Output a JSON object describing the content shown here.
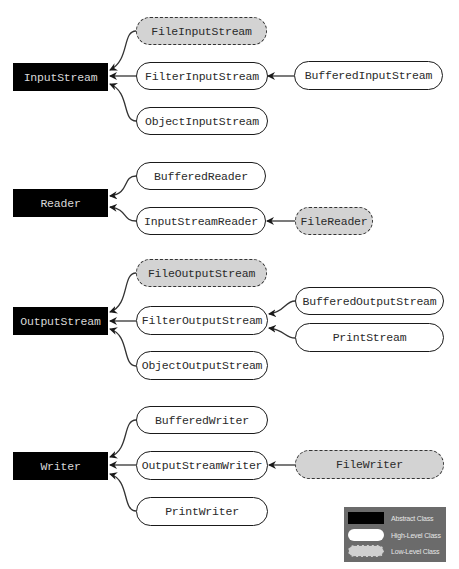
{
  "diagram": {
    "groups": [
      {
        "root": "InputStream",
        "children": [
          "FileInputStream",
          "FilterInputStream",
          "ObjectInputStream"
        ],
        "subchildren": [
          {
            "parent": "FilterInputStream",
            "children": [
              "BufferedInputStream"
            ]
          }
        ]
      },
      {
        "root": "Reader",
        "children": [
          "BufferedReader",
          "InputStreamReader"
        ],
        "subchildren": [
          {
            "parent": "InputStreamReader",
            "children": [
              "FileReader"
            ]
          }
        ]
      },
      {
        "root": "OutputStream",
        "children": [
          "FileOutputStream",
          "FilterOutputStream",
          "ObjectOutputStream"
        ],
        "subchildren": [
          {
            "parent": "FilterOutputStream",
            "children": [
              "BufferedOutputStream",
              "PrintStream"
            ]
          }
        ]
      },
      {
        "root": "Writer",
        "children": [
          "BufferedWriter",
          "OutputStreamWriter",
          "PrintWriter"
        ],
        "subchildren": [
          {
            "parent": "OutputStreamWriter",
            "children": [
              "FileWriter"
            ]
          }
        ]
      }
    ]
  },
  "nodes": {
    "input_stream": {
      "label": "InputStream",
      "kind": "abstract"
    },
    "file_input_stream": {
      "label": "FileInputStream",
      "kind": "low-level"
    },
    "filter_input_stream": {
      "label": "FilterInputStream",
      "kind": "high-level"
    },
    "buffered_input_stream": {
      "label": "BufferedInputStream",
      "kind": "high-level"
    },
    "object_input_stream": {
      "label": "ObjectInputStream",
      "kind": "high-level"
    },
    "reader": {
      "label": "Reader",
      "kind": "abstract"
    },
    "buffered_reader": {
      "label": "BufferedReader",
      "kind": "high-level"
    },
    "input_stream_reader": {
      "label": "InputStreamReader",
      "kind": "high-level"
    },
    "file_reader": {
      "label": "FileReader",
      "kind": "low-level"
    },
    "output_stream": {
      "label": "OutputStream",
      "kind": "abstract"
    },
    "file_output_stream": {
      "label": "FileOutputStream",
      "kind": "low-level"
    },
    "filter_output_stream": {
      "label": "FilterOutputStream",
      "kind": "high-level"
    },
    "buffered_output_stream": {
      "label": "BufferedOutputStream",
      "kind": "high-level"
    },
    "print_stream": {
      "label": "PrintStream",
      "kind": "high-level"
    },
    "object_output_stream": {
      "label": "ObjectOutputStream",
      "kind": "high-level"
    },
    "writer": {
      "label": "Writer",
      "kind": "abstract"
    },
    "buffered_writer": {
      "label": "BufferedWriter",
      "kind": "high-level"
    },
    "output_stream_writer": {
      "label": "OutputStreamWriter",
      "kind": "high-level"
    },
    "file_writer": {
      "label": "FileWriter",
      "kind": "low-level"
    },
    "print_writer": {
      "label": "PrintWriter",
      "kind": "high-level"
    }
  },
  "legend": {
    "items": [
      {
        "label": "Abstract Class",
        "kind": "abstract"
      },
      {
        "label": "High-Level Class",
        "kind": "high-level"
      },
      {
        "label": "Low-Level Class",
        "kind": "low-level"
      }
    ],
    "background": "#6b6b6b"
  },
  "colors": {
    "abstract_fill": "#000000",
    "high_level_fill": "#ffffff",
    "low_level_fill": "#d3d3d3",
    "stroke": "#1a1a1a"
  }
}
